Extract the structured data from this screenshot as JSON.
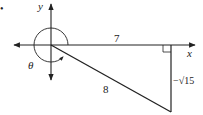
{
  "diagram": {
    "type": "reference-triangle-unit-circle-angle",
    "labels": {
      "y_axis": "y",
      "x_axis": "x",
      "adjacent_side": "7",
      "hypotenuse": "8",
      "opposite_side": "−√15",
      "angle": "θ",
      "bullet": "•"
    },
    "colors": {
      "line": "#222222",
      "background": "#ffffff"
    }
  }
}
